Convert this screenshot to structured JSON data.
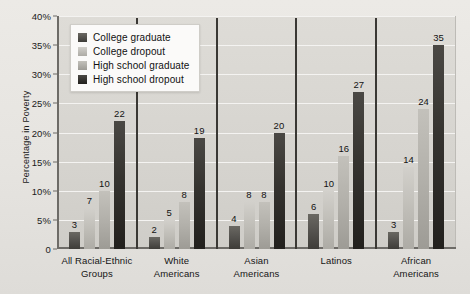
{
  "chart_data": {
    "type": "bar",
    "title": "",
    "xlabel": "",
    "ylabel": "Percentage in Poverty",
    "ylim": [
      0,
      40
    ],
    "ytick_labels": [
      "40%",
      "35%",
      "30%",
      "25%",
      "20%",
      "15%",
      "10%",
      "5%",
      "0"
    ],
    "ytick_values": [
      40,
      35,
      30,
      25,
      20,
      15,
      10,
      5,
      0
    ],
    "grid": true,
    "legend_position": "upper-left-inside",
    "categories": [
      "All Racial-Ethnic\nGroups",
      "White\nAmericans",
      "Asian\nAmericans",
      "Latinos",
      "African\nAmericans"
    ],
    "series": [
      {
        "name": "College graduate",
        "color": "#4e4c48",
        "values": [
          3,
          2,
          4,
          6,
          3
        ]
      },
      {
        "name": "College dropout",
        "color": "#c3c1bb",
        "values": [
          7,
          5,
          8,
          10,
          14
        ]
      },
      {
        "name": "High school graduate",
        "color": "#b2b0aa",
        "values": [
          10,
          8,
          8,
          16,
          24
        ]
      },
      {
        "name": "High school dropout",
        "color": "#2e2c29",
        "values": [
          22,
          19,
          20,
          27,
          35
        ]
      }
    ]
  }
}
